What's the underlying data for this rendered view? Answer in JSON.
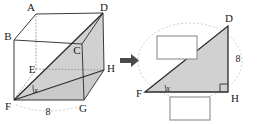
{
  "figure": {
    "background_color": "#ffffff",
    "shade_color": "#c9c9c9",
    "edge_color": "#3a3a3a",
    "hidden_edge_color": "#9a9a9a",
    "box_border_color": "#8e8e8e",
    "arrow_color": "#4a4a4a"
  },
  "prism": {
    "vertices": [
      {
        "id": "A",
        "label": "A",
        "x": 36,
        "y": 14
      },
      {
        "id": "B",
        "label": "B",
        "x": 14,
        "y": 40
      },
      {
        "id": "C",
        "label": "C",
        "x": 82,
        "y": 44
      },
      {
        "id": "D",
        "label": "D",
        "x": 103,
        "y": 13
      },
      {
        "id": "E",
        "label": "E",
        "x": 36,
        "y": 69
      },
      {
        "id": "F",
        "label": "F",
        "x": 14,
        "y": 100
      },
      {
        "id": "G",
        "label": "G",
        "x": 84,
        "y": 100
      },
      {
        "id": "H",
        "label": "H",
        "x": 104,
        "y": 70
      }
    ],
    "base_edge_label": "8",
    "angle_label": "x",
    "shaded_face": "F-D-H",
    "hidden_vertices": [
      "E"
    ]
  },
  "arrow": {
    "glyph": "arrow-right",
    "direction": "right"
  },
  "triangle": {
    "vertices": [
      {
        "id": "D",
        "label": "D",
        "x": 228,
        "y": 26
      },
      {
        "id": "F",
        "label": "F",
        "x": 145,
        "y": 92
      },
      {
        "id": "H",
        "label": "H",
        "x": 228,
        "y": 92
      }
    ],
    "side_labels": [
      {
        "id": "DH",
        "label": "8",
        "side": "vertical"
      }
    ],
    "angle_label": "x",
    "right_angle_at": "H",
    "answer_boxes": [
      {
        "id": "hypotenuse-box",
        "value": "",
        "position": "upper-left"
      },
      {
        "id": "base-box",
        "value": "",
        "position": "below-base"
      }
    ]
  }
}
